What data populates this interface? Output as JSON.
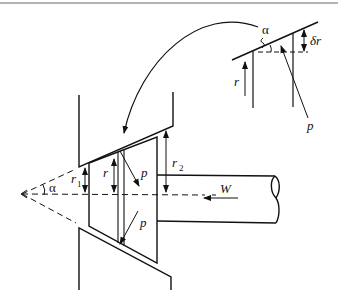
{
  "diagram": {
    "labels": {
      "alpha_inset": "α",
      "delta_r": "δr",
      "r_inset": "r",
      "p_inset": "p",
      "alpha_main": "α",
      "r1": "r",
      "r1_sub": "1",
      "r": "r",
      "r2": "r",
      "r2_sub": "2",
      "p_upper": "p",
      "p_lower": "p",
      "W": "W"
    },
    "colors": {
      "stroke": "#111111",
      "top_rule": "#9a9a9a",
      "background": "#ffffff"
    }
  }
}
